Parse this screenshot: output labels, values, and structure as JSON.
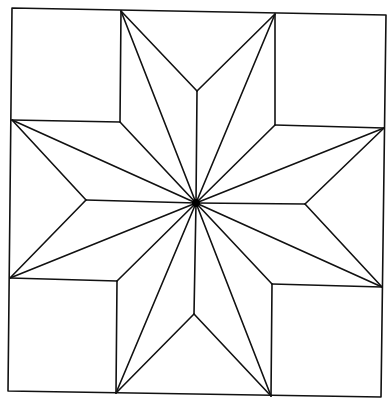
{
  "diagram": {
    "title": "",
    "colors": {
      "stroke": "#111111",
      "background": "#ffffff",
      "hub": "#000000"
    },
    "outer_square": [
      [
        12,
        8
      ],
      [
        386,
        15
      ],
      [
        381,
        397
      ],
      [
        8,
        391
      ]
    ],
    "center": [
      196,
      203
    ],
    "corner_squares": [
      {
        "name": "top-left",
        "points": [
          [
            12,
            8
          ],
          [
            121,
            11
          ],
          [
            120,
            122
          ],
          [
            12,
            120
          ]
        ]
      },
      {
        "name": "top-right",
        "points": [
          [
            275,
            14
          ],
          [
            386,
            15
          ],
          [
            384,
            128
          ],
          [
            275,
            125
          ]
        ]
      },
      {
        "name": "bottom-left",
        "points": [
          [
            10,
            278
          ],
          [
            117,
            281
          ],
          [
            116,
            393
          ],
          [
            8,
            391
          ]
        ]
      },
      {
        "name": "bottom-right",
        "points": [
          [
            272,
            284
          ],
          [
            382,
            287
          ],
          [
            381,
            397
          ],
          [
            271,
            396
          ]
        ]
      }
    ],
    "star_tips": [
      [
        121,
        11
      ],
      [
        275,
        14
      ],
      [
        384,
        128
      ],
      [
        382,
        287
      ],
      [
        271,
        396
      ],
      [
        116,
        393
      ],
      [
        10,
        278
      ],
      [
        12,
        120
      ]
    ],
    "notch_points": {
      "top": [
        197,
        91
      ],
      "right": [
        305,
        204
      ],
      "bottom": [
        194,
        314
      ],
      "left": [
        86,
        200
      ]
    },
    "inner_corners": {
      "top-left": [
        120,
        122
      ],
      "top-right": [
        275,
        125
      ],
      "bottom-right": [
        272,
        284
      ],
      "bottom-left": [
        117,
        281
      ]
    }
  }
}
